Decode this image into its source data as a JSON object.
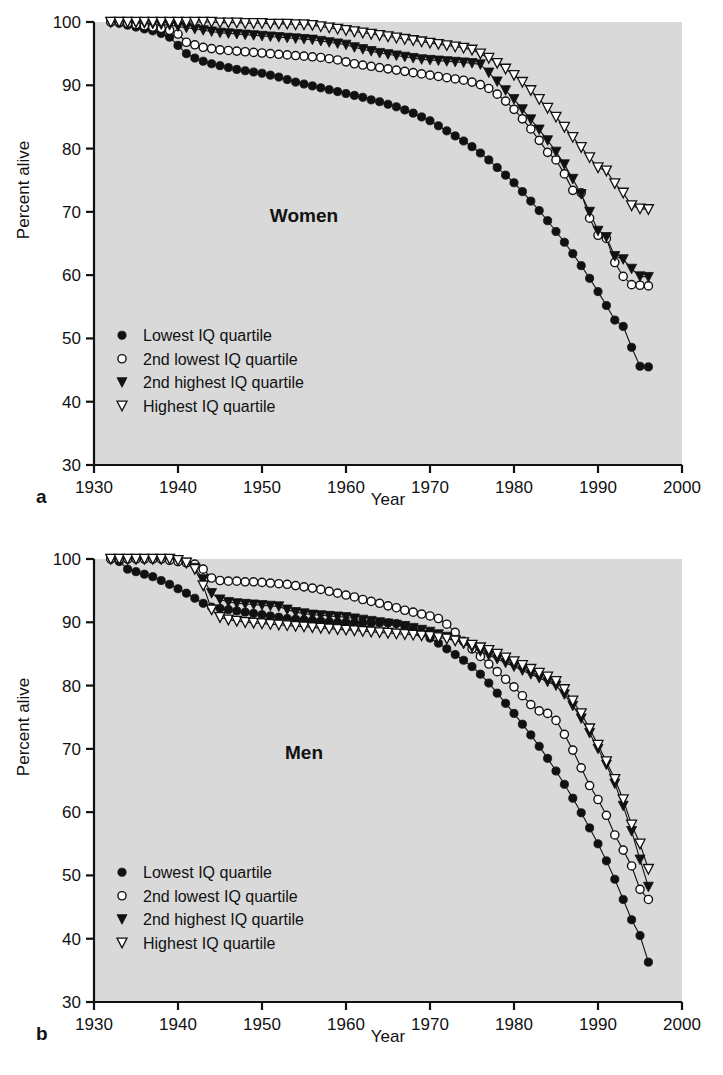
{
  "figure": {
    "axis_label_x": "Year",
    "axis_label_y": "Percent alive",
    "panel_letter_a": "a",
    "panel_letter_b": "b",
    "background_color": "#d9d9d9",
    "ink_color": "#111111"
  },
  "legend": {
    "items": [
      {
        "marker": "filled-circle",
        "label": "Lowest IQ quartile"
      },
      {
        "marker": "open-circle",
        "label": "2nd lowest IQ quartile"
      },
      {
        "marker": "filled-down-triangle",
        "label": "2nd highest IQ quartile"
      },
      {
        "marker": "open-down-triangle",
        "label": "Highest IQ quartile"
      }
    ]
  },
  "chart_data": [
    {
      "type": "line",
      "title": "Women",
      "panel": "a",
      "xlabel": "Year",
      "ylabel": "Percent alive",
      "xlim": [
        1930,
        2000
      ],
      "ylim": [
        30,
        100
      ],
      "xticks": [
        1930,
        1940,
        1950,
        1960,
        1970,
        1980,
        1990,
        2000
      ],
      "yticks": [
        30,
        40,
        50,
        60,
        70,
        80,
        90,
        100
      ],
      "grid": false,
      "legend_position": "lower left",
      "x": [
        1932,
        1933,
        1934,
        1935,
        1936,
        1937,
        1938,
        1939,
        1940,
        1941,
        1942,
        1943,
        1944,
        1945,
        1946,
        1947,
        1948,
        1949,
        1950,
        1951,
        1952,
        1953,
        1954,
        1955,
        1956,
        1957,
        1958,
        1959,
        1960,
        1961,
        1962,
        1963,
        1964,
        1965,
        1966,
        1967,
        1968,
        1969,
        1970,
        1971,
        1972,
        1973,
        1974,
        1975,
        1976,
        1977,
        1978,
        1979,
        1980,
        1981,
        1982,
        1983,
        1984,
        1985,
        1986,
        1987,
        1988,
        1989,
        1990,
        1991,
        1992,
        1993,
        1994,
        1995,
        1996
      ],
      "series": [
        {
          "name": "Lowest IQ quartile",
          "marker": "filled-circle",
          "values": [
            100.0,
            99.8,
            99.5,
            99.2,
            98.9,
            98.6,
            98.2,
            97.6,
            96.3,
            95.0,
            94.3,
            93.8,
            93.4,
            93.1,
            92.8,
            92.5,
            92.3,
            92.1,
            91.9,
            91.6,
            91.3,
            90.9,
            90.5,
            90.2,
            89.9,
            89.6,
            89.3,
            89.0,
            88.7,
            88.4,
            88.1,
            87.7,
            87.4,
            87.0,
            86.6,
            86.1,
            85.6,
            85.0,
            84.4,
            83.6,
            82.8,
            82.0,
            81.2,
            80.3,
            79.3,
            78.2,
            77.0,
            75.8,
            74.6,
            73.2,
            71.7,
            70.2,
            68.6,
            66.9,
            65.2,
            63.4,
            61.5,
            59.5,
            57.4,
            55.2,
            52.9,
            51.9,
            48.6,
            45.6,
            45.5
          ]
        },
        {
          "name": "2nd lowest IQ quartile",
          "marker": "open-circle",
          "values": [
            100.0,
            100.0,
            99.8,
            99.6,
            99.4,
            99.2,
            99.0,
            98.7,
            98.1,
            96.8,
            96.4,
            96.0,
            95.8,
            95.6,
            95.5,
            95.4,
            95.3,
            95.2,
            95.1,
            95.0,
            94.9,
            94.8,
            94.7,
            94.6,
            94.5,
            94.4,
            94.2,
            94.0,
            93.7,
            93.4,
            93.2,
            93.0,
            92.8,
            92.6,
            92.4,
            92.2,
            92.0,
            91.8,
            91.6,
            91.4,
            91.2,
            91.0,
            90.8,
            90.5,
            90.1,
            89.5,
            88.6,
            87.5,
            86.2,
            84.7,
            83.1,
            81.3,
            79.4,
            78.2,
            76.0,
            73.4,
            73.0,
            69.0,
            66.3,
            65.8,
            62.0,
            59.8,
            58.5,
            58.4,
            58.3
          ]
        },
        {
          "name": "2nd highest IQ quartile",
          "marker": "filled-down-triangle",
          "values": [
            100.0,
            100.0,
            100.0,
            99.9,
            99.8,
            99.7,
            99.6,
            99.5,
            99.3,
            99.1,
            98.9,
            98.7,
            98.5,
            98.3,
            98.2,
            98.1,
            98.0,
            97.9,
            97.8,
            97.7,
            97.6,
            97.5,
            97.4,
            97.3,
            97.2,
            97.0,
            96.8,
            96.6,
            96.4,
            96.0,
            95.7,
            95.4,
            95.1,
            94.9,
            94.7,
            94.5,
            94.3,
            94.1,
            94.0,
            93.9,
            93.8,
            93.7,
            93.6,
            93.5,
            93.3,
            92.0,
            90.6,
            89.2,
            87.8,
            86.2,
            84.6,
            83.0,
            81.3,
            79.5,
            77.5,
            75.2,
            72.8,
            70.0,
            67.0,
            66.0,
            63.0,
            62.5,
            61.0,
            59.8,
            59.7
          ]
        },
        {
          "name": "Highest IQ quartile",
          "marker": "open-down-triangle",
          "values": [
            100.0,
            100.0,
            100.0,
            100.0,
            100.0,
            100.0,
            100.0,
            100.0,
            100.0,
            100.0,
            100.0,
            100.0,
            100.0,
            99.9,
            99.9,
            99.9,
            99.8,
            99.8,
            99.8,
            99.7,
            99.7,
            99.7,
            99.6,
            99.6,
            99.5,
            99.3,
            99.1,
            98.9,
            98.7,
            98.5,
            98.3,
            98.1,
            97.9,
            97.7,
            97.5,
            97.3,
            97.1,
            96.9,
            96.7,
            96.5,
            96.3,
            96.1,
            95.9,
            95.6,
            95.0,
            94.3,
            93.5,
            92.6,
            91.6,
            90.5,
            89.2,
            87.8,
            86.4,
            85.0,
            83.4,
            81.8,
            80.2,
            78.6,
            77.0,
            76.5,
            74.5,
            73.0,
            71.0,
            70.5,
            70.4
          ]
        }
      ]
    },
    {
      "type": "line",
      "title": "Men",
      "panel": "b",
      "xlabel": "Year",
      "ylabel": "Percent alive",
      "xlim": [
        1930,
        2000
      ],
      "ylim": [
        30,
        100
      ],
      "xticks": [
        1930,
        1940,
        1950,
        1960,
        1970,
        1980,
        1990,
        2000
      ],
      "yticks": [
        30,
        40,
        50,
        60,
        70,
        80,
        90,
        100
      ],
      "grid": false,
      "legend_position": "lower left",
      "x": [
        1932,
        1933,
        1934,
        1935,
        1936,
        1937,
        1938,
        1939,
        1940,
        1941,
        1942,
        1943,
        1944,
        1945,
        1946,
        1947,
        1948,
        1949,
        1950,
        1951,
        1952,
        1953,
        1954,
        1955,
        1956,
        1957,
        1958,
        1959,
        1960,
        1961,
        1962,
        1963,
        1964,
        1965,
        1966,
        1967,
        1968,
        1969,
        1970,
        1971,
        1972,
        1973,
        1974,
        1975,
        1976,
        1977,
        1978,
        1979,
        1980,
        1981,
        1982,
        1983,
        1984,
        1985,
        1986,
        1987,
        1988,
        1989,
        1990,
        1991,
        1992,
        1993,
        1994,
        1995,
        1996
      ],
      "series": [
        {
          "name": "Lowest IQ quartile",
          "marker": "filled-circle",
          "values": [
            100.0,
            99.6,
            98.4,
            98.0,
            97.6,
            97.2,
            96.6,
            96.0,
            95.3,
            94.6,
            93.8,
            93.0,
            92.4,
            92.2,
            92.0,
            91.8,
            91.6,
            91.4,
            91.2,
            91.0,
            90.8,
            90.6,
            90.5,
            90.4,
            90.3,
            90.2,
            90.1,
            90.0,
            90.0,
            89.9,
            89.9,
            89.9,
            89.9,
            89.9,
            89.8,
            89.4,
            88.8,
            88.2,
            87.5,
            86.7,
            85.8,
            84.9,
            84.0,
            83.0,
            81.8,
            80.4,
            78.8,
            77.2,
            75.6,
            73.9,
            72.2,
            70.4,
            68.5,
            66.5,
            64.4,
            62.2,
            59.9,
            57.5,
            55.0,
            52.3,
            49.4,
            46.2,
            43.0,
            40.5,
            36.3,
            35.8
          ]
        },
        {
          "name": "2nd lowest IQ quartile",
          "marker": "open-circle",
          "values": [
            100.0,
            100.0,
            100.0,
            100.0,
            100.0,
            100.0,
            100.0,
            99.8,
            99.6,
            99.4,
            99.2,
            98.4,
            97.0,
            96.6,
            96.5,
            96.5,
            96.4,
            96.4,
            96.3,
            96.2,
            96.1,
            96.0,
            95.8,
            95.6,
            95.4,
            95.2,
            94.9,
            94.6,
            94.3,
            94.0,
            93.6,
            93.3,
            93.0,
            92.6,
            92.3,
            91.9,
            91.6,
            91.3,
            91.0,
            90.6,
            89.7,
            88.4,
            87.0,
            85.8,
            84.6,
            83.4,
            82.2,
            81.0,
            79.8,
            78.4,
            77.0,
            76.0,
            75.6,
            74.5,
            72.3,
            69.8,
            67.0,
            64.2,
            62.0,
            59.5,
            56.4,
            54.0,
            51.5,
            47.8,
            46.2,
            45.8
          ]
        },
        {
          "name": "2nd highest IQ quartile",
          "marker": "filled-down-triangle",
          "values": [
            100.0,
            100.0,
            100.0,
            100.0,
            100.0,
            100.0,
            100.0,
            100.0,
            99.8,
            99.4,
            98.6,
            96.8,
            94.6,
            93.6,
            93.2,
            93.0,
            92.9,
            92.8,
            92.7,
            92.6,
            92.5,
            92.0,
            91.6,
            91.4,
            91.2,
            91.1,
            91.0,
            90.9,
            90.8,
            90.6,
            90.4,
            90.2,
            90.0,
            89.8,
            89.6,
            89.4,
            89.1,
            88.8,
            88.5,
            88.1,
            87.7,
            87.2,
            86.6,
            86.0,
            85.4,
            84.8,
            84.2,
            83.6,
            83.0,
            82.4,
            81.8,
            81.2,
            80.6,
            80.0,
            78.6,
            76.8,
            74.8,
            72.5,
            70.0,
            67.5,
            64.5,
            61.0,
            57.0,
            52.5,
            48.2,
            46.6
          ]
        },
        {
          "name": "Highest IQ quartile",
          "marker": "open-down-triangle",
          "values": [
            100.0,
            100.0,
            100.0,
            100.0,
            100.0,
            100.0,
            100.0,
            100.0,
            99.8,
            99.4,
            98.4,
            95.8,
            92.0,
            90.8,
            90.4,
            90.2,
            90.0,
            89.9,
            89.8,
            89.7,
            89.6,
            89.5,
            89.4,
            89.3,
            89.2,
            89.1,
            89.0,
            88.9,
            88.8,
            88.7,
            88.6,
            88.5,
            88.4,
            88.3,
            88.2,
            88.1,
            88.0,
            87.9,
            87.8,
            87.6,
            87.4,
            87.1,
            86.8,
            86.4,
            86.0,
            85.6,
            85.0,
            84.4,
            83.8,
            83.2,
            82.6,
            82.0,
            81.4,
            80.7,
            79.4,
            77.6,
            75.6,
            73.2,
            70.6,
            68.0,
            65.2,
            62.0,
            58.0,
            55.0,
            51.0,
            49.7
          ]
        }
      ]
    }
  ]
}
